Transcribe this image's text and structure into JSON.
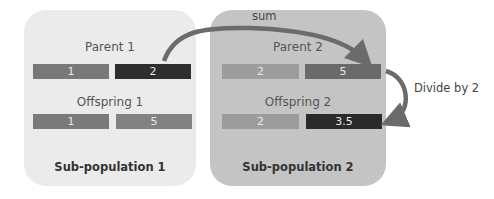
{
  "subpop1": {
    "title": "Sub-population 1",
    "parent_label": "Parent 1",
    "offspring_label": "Offspring 1",
    "parent_genes": [
      {
        "value": "1",
        "color": "#787878"
      },
      {
        "value": "2",
        "color": "#2e2e2e"
      }
    ],
    "offspring_genes": [
      {
        "value": "1",
        "color": "#7a7a7a"
      },
      {
        "value": "5",
        "color": "#828282"
      }
    ],
    "background": "#ebebeb"
  },
  "subpop2": {
    "title": "Sub-population 2",
    "parent_label": "Parent 2",
    "offspring_label": "Offspring 2",
    "parent_genes": [
      {
        "value": "2",
        "color": "#9c9c9c"
      },
      {
        "value": "5",
        "color": "#6a6a6a"
      }
    ],
    "offspring_genes": [
      {
        "value": "2",
        "color": "#9c9c9c"
      },
      {
        "value": "3.5",
        "color": "#2a2a2a"
      }
    ],
    "background": "#c4c4c4"
  },
  "annotations": {
    "sum_label": "sum",
    "divide_label": "Divide by 2",
    "arrow_color": "#6b6b6b"
  }
}
